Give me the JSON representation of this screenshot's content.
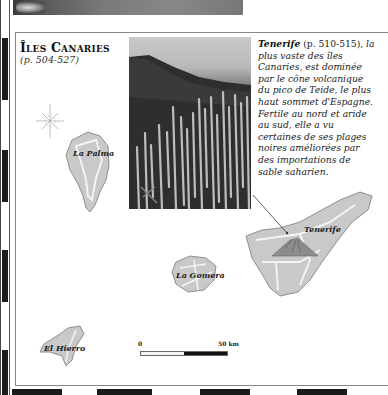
{
  "page": {
    "section_title": "Îles Canaries",
    "section_pages": "(p. 504-527)"
  },
  "photo": {
    "subject": "cactus-forest-and-mountain-slope"
  },
  "caption": {
    "island_name": "Tenerife",
    "page_ref": " (p. 510-515),",
    "text": " la plus vaste des îles Canaries, est dominée par le cône volcanique du pico de Teide, le plus haut sommet d'Espagne. Fertile au nord et aride au sud, elle a vu certaines de ses plages noires améliorées par des importations de sable saharien."
  },
  "map": {
    "islands": [
      {
        "name": "La Palma"
      },
      {
        "name": "Tenerife"
      },
      {
        "name": "La Gomera"
      },
      {
        "name": "El Hierro"
      }
    ],
    "compass": "compass-rose",
    "scale": {
      "start": "0",
      "end": "50 km"
    },
    "colors": {
      "land": "#c9c9c9",
      "road": "#f4f4f4",
      "outline": "#8f8f8f"
    }
  }
}
